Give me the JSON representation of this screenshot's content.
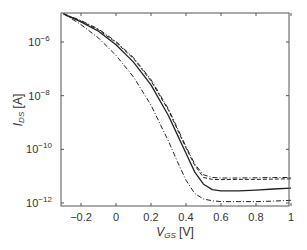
{
  "chart_data": {
    "type": "line",
    "title": "",
    "xlabel": "V_GS [V]",
    "ylabel": "I_DS [A]",
    "xlabel_main": "V",
    "xlabel_sub": "GS",
    "xlabel_unit": " [V]",
    "ylabel_main": "I",
    "ylabel_sub": "DS",
    "ylabel_unit": " [A]",
    "xlim": [
      -0.3,
      1.0
    ],
    "ylim": [
      1e-12,
      1.2e-05
    ],
    "yscale": "log",
    "grid": false,
    "legend": null,
    "x_ticks": [
      -0.2,
      0,
      0.2,
      0.4,
      0.6,
      0.8,
      1
    ],
    "x_tick_labels": [
      "−0.2",
      "0",
      "0.2",
      "0.4",
      "0.6",
      "0.8",
      "1"
    ],
    "y_ticks_log10": [
      -6,
      -8,
      -10,
      -12
    ],
    "y_tick_labels": [
      "10",
      "10",
      "10",
      "10"
    ],
    "y_tick_exponents": [
      "−6",
      "−8",
      "−10",
      "−12"
    ],
    "series": [
      {
        "name": "solid",
        "style": "solid",
        "x": [
          -0.3,
          -0.2,
          -0.1,
          0.0,
          0.1,
          0.2,
          0.3,
          0.35,
          0.4,
          0.45,
          0.5,
          0.55,
          0.6,
          0.7,
          0.8,
          0.9,
          1.0
        ],
        "log10_y": [
          -4.95,
          -5.25,
          -5.6,
          -6.1,
          -6.75,
          -7.6,
          -8.75,
          -9.45,
          -10.15,
          -10.85,
          -11.3,
          -11.5,
          -11.55,
          -11.55,
          -11.52,
          -11.48,
          -11.45
        ]
      },
      {
        "name": "dashed",
        "style": "dashed",
        "x": [
          -0.3,
          -0.2,
          -0.1,
          0.0,
          0.1,
          0.2,
          0.3,
          0.35,
          0.4,
          0.45,
          0.5,
          0.55,
          0.6,
          0.7,
          0.8,
          0.9,
          1.0
        ],
        "log10_y": [
          -4.95,
          -5.22,
          -5.55,
          -6.02,
          -6.62,
          -7.45,
          -8.55,
          -9.25,
          -9.95,
          -10.6,
          -11.05,
          -11.12,
          -11.13,
          -11.12,
          -11.12,
          -11.11,
          -11.1
        ]
      },
      {
        "name": "dashdot-upper",
        "style": "dashdot",
        "x": [
          -0.3,
          -0.2,
          -0.1,
          0.0,
          0.1,
          0.2,
          0.3,
          0.35,
          0.4,
          0.45,
          0.5,
          0.55,
          0.6,
          0.7,
          0.8,
          0.9,
          1.0
        ],
        "log10_y": [
          -4.95,
          -5.2,
          -5.52,
          -5.98,
          -6.58,
          -7.4,
          -8.5,
          -9.2,
          -9.9,
          -10.55,
          -10.95,
          -11.05,
          -11.07,
          -11.07,
          -11.06,
          -11.05,
          -11.05
        ]
      },
      {
        "name": "dashdot-lower",
        "style": "dashdot",
        "x": [
          -0.3,
          -0.2,
          -0.1,
          0.0,
          0.1,
          0.2,
          0.3,
          0.35,
          0.4,
          0.45,
          0.5,
          0.55,
          0.6,
          0.7,
          0.8,
          0.9,
          1.0
        ],
        "log10_y": [
          -4.95,
          -5.35,
          -5.85,
          -6.5,
          -7.3,
          -8.35,
          -9.7,
          -10.45,
          -11.15,
          -11.65,
          -11.85,
          -11.92,
          -11.95,
          -11.95,
          -11.95,
          -11.93,
          -11.9
        ]
      }
    ],
    "colors": {
      "line": "#222222",
      "axis": "#555555"
    }
  }
}
